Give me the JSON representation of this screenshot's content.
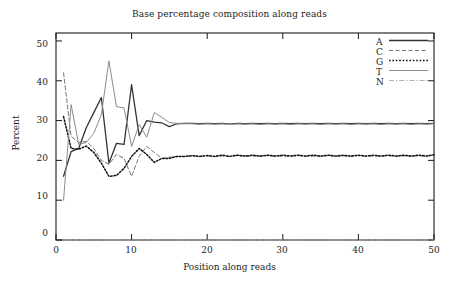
{
  "chart_data": {
    "type": "line",
    "title": "Base percentage composition along reads",
    "xlabel": "Position along reads",
    "ylabel": "Percent",
    "xlim": [
      0,
      50
    ],
    "ylim": [
      0,
      52
    ],
    "xticks": [
      0,
      10,
      20,
      30,
      40,
      50
    ],
    "yticks": [
      0,
      10,
      20,
      30,
      40,
      50
    ],
    "grid": false,
    "legend_position": "top-right-inside",
    "x": [
      1,
      2,
      3,
      4,
      5,
      6,
      7,
      8,
      9,
      10,
      11,
      12,
      13,
      14,
      15,
      16,
      17,
      18,
      19,
      20,
      21,
      22,
      23,
      24,
      25,
      26,
      27,
      28,
      29,
      30,
      31,
      32,
      33,
      34,
      35,
      36,
      37,
      38,
      39,
      40,
      41,
      42,
      43,
      44,
      45,
      46,
      47,
      48,
      49,
      50
    ],
    "series": [
      {
        "name": "A",
        "style": "solid",
        "color": "#333333",
        "width": 1.3,
        "values": [
          16.0,
          22.2,
          23.0,
          28.2,
          32.0,
          35.8,
          19.3,
          24.3,
          24.0,
          39.0,
          26.2,
          30.0,
          29.6,
          29.4,
          28.5,
          29.2,
          29.3,
          29.3,
          29.2,
          29.3,
          29.2,
          29.3,
          29.1,
          29.3,
          29.2,
          29.3,
          29.2,
          29.3,
          29.2,
          29.3,
          29.2,
          29.3,
          29.2,
          29.3,
          29.2,
          29.3,
          29.2,
          29.3,
          29.2,
          29.3,
          29.2,
          29.3,
          29.2,
          29.3,
          29.2,
          29.3,
          29.2,
          29.3,
          29.2,
          29.3
        ]
      },
      {
        "name": "C",
        "style": "dashed",
        "color": "#777777",
        "width": 1.0,
        "values": [
          42.0,
          26.0,
          24.5,
          24.8,
          23.0,
          20.0,
          19.0,
          21.5,
          20.5,
          16.0,
          21.0,
          23.5,
          22.0,
          20.5,
          20.8,
          21.0,
          21.0,
          21.1,
          21.0,
          21.2,
          21.0,
          21.1,
          21.0,
          21.2,
          21.0,
          21.1,
          21.0,
          21.2,
          21.0,
          21.1,
          21.0,
          21.2,
          21.0,
          21.1,
          21.0,
          21.2,
          21.0,
          21.1,
          21.0,
          21.2,
          21.0,
          21.1,
          21.0,
          21.2,
          21.0,
          21.1,
          21.0,
          21.2,
          21.0,
          21.4
        ]
      },
      {
        "name": "G",
        "style": "dotted",
        "color": "#111111",
        "width": 1.5,
        "values": [
          31.0,
          23.0,
          22.8,
          23.6,
          22.0,
          19.3,
          16.0,
          16.2,
          18.0,
          21.0,
          23.0,
          21.5,
          19.5,
          20.5,
          20.5,
          21.0,
          21.0,
          21.2,
          21.0,
          21.2,
          21.0,
          21.3,
          21.0,
          21.3,
          21.1,
          21.3,
          21.1,
          21.3,
          21.1,
          21.3,
          21.1,
          21.3,
          21.1,
          21.3,
          21.1,
          21.3,
          21.1,
          21.3,
          21.1,
          21.3,
          21.1,
          21.3,
          21.1,
          21.3,
          21.1,
          21.3,
          21.1,
          21.3,
          21.1,
          21.4
        ]
      },
      {
        "name": "T",
        "style": "solid",
        "color": "#8c8c8c",
        "width": 1.0,
        "values": [
          10.0,
          34.0,
          24.0,
          24.5,
          26.8,
          31.5,
          45.0,
          33.5,
          33.2,
          23.5,
          29.0,
          25.8,
          32.0,
          30.8,
          29.5,
          29.3,
          29.2,
          29.2,
          29.1,
          29.2,
          29.1,
          29.2,
          29.0,
          29.2,
          29.1,
          29.2,
          29.0,
          29.2,
          29.1,
          29.2,
          29.0,
          29.2,
          29.1,
          29.2,
          29.0,
          29.2,
          29.1,
          29.2,
          29.0,
          29.2,
          29.1,
          29.2,
          29.0,
          29.2,
          29.1,
          29.2,
          29.0,
          29.2,
          29.1,
          29.2
        ]
      },
      {
        "name": "N",
        "style": "dashdot",
        "color": "#a9a9a9",
        "width": 0.9,
        "values": [
          0,
          0,
          0,
          0,
          0,
          0,
          0,
          0,
          0,
          0,
          0,
          0,
          0,
          0,
          0,
          0,
          0,
          0,
          0,
          0,
          0,
          0,
          0,
          0,
          0,
          0,
          0,
          0,
          0,
          0,
          0,
          0,
          0,
          0,
          0,
          0,
          0,
          0,
          0,
          0,
          0,
          0,
          0,
          0,
          0,
          0,
          0,
          0,
          0,
          0
        ]
      }
    ]
  },
  "legend": {
    "items": [
      {
        "label": "A"
      },
      {
        "label": "C"
      },
      {
        "label": "G"
      },
      {
        "label": "T"
      },
      {
        "label": "N"
      }
    ]
  },
  "axes": {
    "y_tick_labels": [
      "50",
      "40",
      "30",
      "20",
      "10",
      "0"
    ],
    "x_tick_labels": [
      "0",
      "10",
      "20",
      "30",
      "40",
      "50"
    ]
  }
}
